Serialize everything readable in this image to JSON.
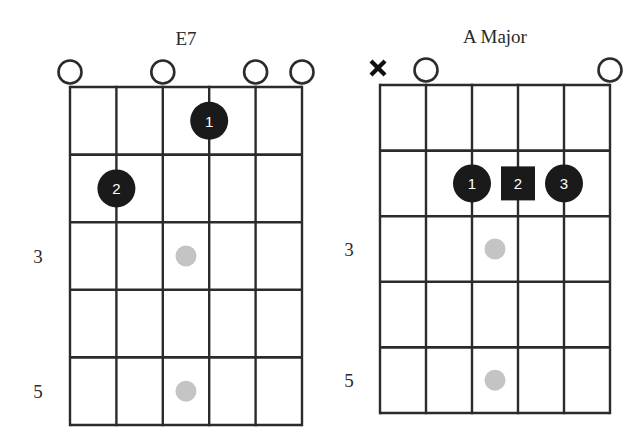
{
  "chords": [
    {
      "name": "E7",
      "grid": {
        "x0": 70,
        "y0": 87,
        "x1": 302,
        "y1": 425,
        "strings": 6,
        "frets": 5
      },
      "title_pos": {
        "x": 186,
        "y": 45
      },
      "fret_labels": [
        {
          "fret": 3,
          "text": "3",
          "x": 38
        },
        {
          "fret": 5,
          "text": "5",
          "x": 38
        }
      ],
      "open_strings": [
        1,
        3,
        5,
        6
      ],
      "muted_strings": [],
      "fingers": [
        {
          "string": 4,
          "fret": 1,
          "finger": "1",
          "shape": "circle"
        },
        {
          "string": 2,
          "fret": 2,
          "finger": "2",
          "shape": "circle"
        }
      ],
      "inlays": [
        {
          "string_between": 3.5,
          "fret": 3
        },
        {
          "string_between": 3.5,
          "fret": 5
        }
      ]
    },
    {
      "name": "A Major",
      "grid": {
        "x0": 380,
        "y0": 85,
        "x1": 610,
        "y1": 413,
        "strings": 6,
        "frets": 5
      },
      "title_pos": {
        "x": 495,
        "y": 43
      },
      "fret_labels": [
        {
          "fret": 3,
          "text": "3",
          "x": 349
        },
        {
          "fret": 5,
          "text": "5",
          "x": 349
        }
      ],
      "open_strings": [
        2,
        6
      ],
      "muted_strings": [
        1
      ],
      "fingers": [
        {
          "string": 3,
          "fret": 2,
          "finger": "1",
          "shape": "circle"
        },
        {
          "string": 4,
          "fret": 2,
          "finger": "2",
          "shape": "square"
        },
        {
          "string": 5,
          "fret": 2,
          "finger": "3",
          "shape": "circle"
        }
      ],
      "inlays": [
        {
          "string_between": 3.5,
          "fret": 3
        },
        {
          "string_between": 3.5,
          "fret": 5
        }
      ]
    }
  ],
  "colors": {
    "line": "#2b2b2b",
    "finger_fill": "#1a1a1a",
    "finger_text": "#ffffff",
    "inlay": "#c4c4c4",
    "background": "#ffffff"
  }
}
